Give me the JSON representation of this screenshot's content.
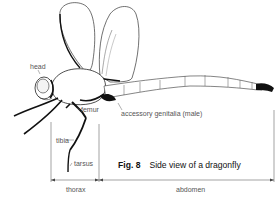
{
  "figure": {
    "number": "Fig. 8",
    "title": "Side view of a dragonfly"
  },
  "labels": {
    "head": "head",
    "femur": "femur",
    "tibia": "tibia",
    "tarsus": "tarsus",
    "accessory_genitalia": "accessory genitalia (male)",
    "thorax": "thorax",
    "abdomen": "abdomen"
  },
  "colors": {
    "ink": "#111111",
    "outline": "#444444",
    "label_text": "#555555",
    "background": "#ffffff"
  }
}
